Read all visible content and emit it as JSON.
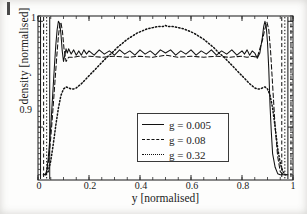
{
  "figure": {
    "background_color": "#fdfdfc",
    "axis_color": "#2a2a2a"
  },
  "axes": {
    "x_title": "y [normalised]",
    "y_title": "density [normalised]",
    "x_ticks": [
      "0",
      "0.2",
      "0.4",
      "0.6",
      "0.8",
      "1"
    ],
    "y_ticks": [
      "0.9",
      "1"
    ]
  },
  "legend": {
    "entries": [
      {
        "label": "g = 0.005",
        "style": "solid"
      },
      {
        "label": "g = 0.08",
        "style": "dashed"
      },
      {
        "label": "g = 0.32",
        "style": "dotted"
      }
    ]
  },
  "chart_data": {
    "type": "line",
    "title": "",
    "xlabel": "y [normalised]",
    "ylabel": "density [normalised]",
    "xlim": [
      0,
      1
    ],
    "ylim": [
      0.85,
      1.005
    ],
    "xticks": [
      0,
      0.2,
      0.4,
      0.6,
      0.8,
      1
    ],
    "yticks": [
      0.9,
      1
    ],
    "grid": false,
    "legend_position": "center",
    "minor_ticks": true,
    "series": [
      {
        "name": "g = 0.005",
        "style": "solid",
        "color": "#111111",
        "x": [
          0.02,
          0.03,
          0.035,
          0.04,
          0.045,
          0.05,
          0.055,
          0.06,
          0.065,
          0.07,
          0.075,
          0.08,
          0.085,
          0.09,
          0.095,
          0.1,
          0.105,
          0.11,
          0.115,
          0.12,
          0.13,
          0.14,
          0.15,
          0.16,
          0.17,
          0.18,
          0.19,
          0.2,
          0.22,
          0.24,
          0.26,
          0.28,
          0.3,
          0.32,
          0.34,
          0.36,
          0.38,
          0.4,
          0.42,
          0.44,
          0.46,
          0.48,
          0.5,
          0.52,
          0.54,
          0.56,
          0.58,
          0.6,
          0.62,
          0.64,
          0.66,
          0.68,
          0.7,
          0.72,
          0.74,
          0.76,
          0.78,
          0.8,
          0.81,
          0.82,
          0.83,
          0.84,
          0.85,
          0.86,
          0.87,
          0.88,
          0.885,
          0.89,
          0.895,
          0.9,
          0.905,
          0.91,
          0.915,
          0.92,
          0.93,
          0.94,
          0.95,
          0.96,
          0.97,
          0.98
        ],
        "y": [
          0.855,
          0.855,
          0.86,
          0.87,
          0.885,
          0.9,
          0.92,
          0.94,
          0.96,
          0.978,
          0.992,
          1.0,
          0.998,
          0.988,
          0.972,
          0.962,
          0.968,
          0.974,
          0.97,
          0.974,
          0.969,
          0.973,
          0.968,
          0.972,
          0.968,
          0.973,
          0.969,
          0.972,
          0.968,
          0.973,
          0.969,
          0.972,
          0.968,
          0.973,
          0.969,
          0.972,
          0.968,
          0.973,
          0.969,
          0.972,
          0.968,
          0.973,
          0.97,
          0.973,
          0.968,
          0.972,
          0.969,
          0.973,
          0.968,
          0.972,
          0.969,
          0.973,
          0.968,
          0.972,
          0.969,
          0.973,
          0.968,
          0.972,
          0.969,
          0.973,
          0.968,
          0.972,
          0.97,
          0.965,
          0.97,
          0.985,
          0.995,
          1.0,
          0.995,
          0.98,
          0.955,
          0.92,
          0.895,
          0.875,
          0.862,
          0.856,
          0.855,
          0.855,
          0.855,
          0.855
        ]
      },
      {
        "name": "g = 0.08",
        "style": "dashed",
        "color": "#111111",
        "x": [
          0.022,
          0.032,
          0.038,
          0.044,
          0.05,
          0.056,
          0.062,
          0.068,
          0.074,
          0.08,
          0.086,
          0.09,
          0.096,
          0.102,
          0.11,
          0.12,
          0.14,
          0.16,
          0.18,
          0.2,
          0.25,
          0.3,
          0.35,
          0.4,
          0.45,
          0.5,
          0.55,
          0.6,
          0.65,
          0.7,
          0.75,
          0.8,
          0.82,
          0.84,
          0.86,
          0.88,
          0.89,
          0.898,
          0.905,
          0.912,
          0.92,
          0.93,
          0.94,
          0.95,
          0.962,
          0.975
        ],
        "y": [
          0.855,
          0.856,
          0.862,
          0.874,
          0.89,
          0.908,
          0.928,
          0.948,
          0.968,
          0.986,
          0.998,
          0.999,
          0.99,
          0.974,
          0.962,
          0.966,
          0.966,
          0.967,
          0.966,
          0.967,
          0.966,
          0.967,
          0.966,
          0.967,
          0.966,
          0.968,
          0.966,
          0.967,
          0.966,
          0.967,
          0.966,
          0.967,
          0.966,
          0.967,
          0.966,
          0.982,
          0.993,
          0.999,
          0.992,
          0.972,
          0.94,
          0.9,
          0.872,
          0.858,
          0.855,
          0.855
        ]
      },
      {
        "name": "g = 0.32",
        "style": "dotted",
        "color": "#111111",
        "x": [
          0.03,
          0.04,
          0.05,
          0.06,
          0.07,
          0.08,
          0.09,
          0.1,
          0.11,
          0.12,
          0.13,
          0.14,
          0.15,
          0.17,
          0.19,
          0.21,
          0.23,
          0.25,
          0.27,
          0.29,
          0.31,
          0.33,
          0.35,
          0.37,
          0.39,
          0.41,
          0.43,
          0.45,
          0.47,
          0.49,
          0.5,
          0.51,
          0.53,
          0.55,
          0.57,
          0.59,
          0.61,
          0.63,
          0.65,
          0.67,
          0.69,
          0.71,
          0.73,
          0.75,
          0.77,
          0.79,
          0.81,
          0.83,
          0.85,
          0.86,
          0.87,
          0.88,
          0.89,
          0.9,
          0.91,
          0.92,
          0.93,
          0.94,
          0.95,
          0.96,
          0.97
        ],
        "y": [
          0.855,
          0.858,
          0.868,
          0.884,
          0.902,
          0.918,
          0.93,
          0.936,
          0.938,
          0.937,
          0.936,
          0.936,
          0.937,
          0.941,
          0.946,
          0.951,
          0.956,
          0.961,
          0.966,
          0.97,
          0.975,
          0.979,
          0.983,
          0.986,
          0.989,
          0.991,
          0.993,
          0.994,
          0.995,
          0.995,
          0.996,
          0.995,
          0.995,
          0.994,
          0.993,
          0.991,
          0.989,
          0.986,
          0.983,
          0.979,
          0.975,
          0.97,
          0.966,
          0.961,
          0.956,
          0.951,
          0.946,
          0.941,
          0.937,
          0.936,
          0.936,
          0.937,
          0.938,
          0.936,
          0.93,
          0.918,
          0.9,
          0.88,
          0.866,
          0.858,
          0.855
        ]
      }
    ],
    "wall_lines": {
      "description": "Near-vertical traces at the container walls where all three curves drop off the bottom of the axis",
      "x_positions": [
        0.01,
        0.022,
        0.034,
        0.046,
        0.956,
        0.968,
        0.98,
        0.992
      ]
    }
  }
}
